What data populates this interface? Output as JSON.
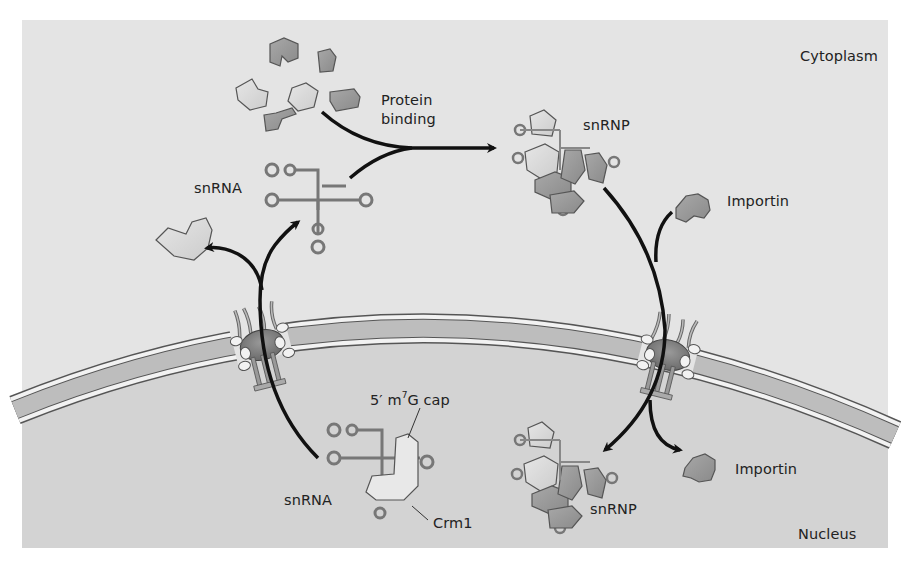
{
  "diagram": {
    "regions": {
      "cytoplasm": "Cytoplasm",
      "nucleus": "Nucleus"
    },
    "labels": {
      "protein_binding_line1": "Protein",
      "protein_binding_line2": "binding",
      "snrna_cytoplasm": "snRNA",
      "snrnp_cytoplasm": "snRNP",
      "importin_cytoplasm": "Importin",
      "cap_prefix": "5′ m",
      "cap_sup": "7",
      "cap_suffix": "G cap",
      "snrna_nucleus": "snRNA",
      "crm1": "Crm1",
      "snrnp_nucleus": "snRNP",
      "importin_nucleus": "Importin"
    },
    "colors": {
      "cytoplasm_bg": "#e4e4e4",
      "nucleus_bg": "#d2d2d2",
      "membrane": "#bcbcbc",
      "protein_dark": "#9a9a9a",
      "protein_light": "#d9d9d9",
      "arrow": "#111111",
      "rna": "#8a8a8a"
    }
  }
}
